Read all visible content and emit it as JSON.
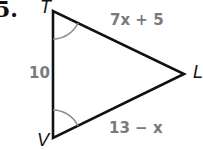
{
  "problem": {
    "number": "5."
  },
  "triangle": {
    "vertices": {
      "T": {
        "label": "T",
        "x": 53,
        "y": 11
      },
      "V": {
        "label": "V",
        "x": 53,
        "y": 138
      },
      "L": {
        "label": "L",
        "x": 184,
        "y": 74
      }
    },
    "sides": {
      "TV": {
        "label": "10"
      },
      "TL": {
        "label": "7x + 5"
      },
      "VL": {
        "label": "13 − x"
      }
    },
    "congruent_angles": [
      "T",
      "V"
    ],
    "colors": {
      "stroke": "#111111",
      "arc": "#8a8a8a",
      "side_label": "#7a7a7a"
    }
  }
}
